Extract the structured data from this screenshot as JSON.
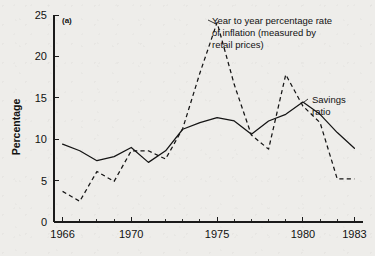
{
  "panel": {
    "label": "(a)"
  },
  "chart_data": {
    "type": "line",
    "title": "",
    "subtitle": "",
    "xlabel": "",
    "ylabel": "Percentage",
    "xlim": [
      1965.5,
      1983.5
    ],
    "ylim": [
      0,
      25
    ],
    "grid": false,
    "legend_position": "inline-annotation",
    "y_ticks": [
      0,
      5,
      10,
      15,
      20,
      25
    ],
    "y_tick_labels": [
      "0",
      "5",
      "10",
      "15",
      "20",
      "25"
    ],
    "x_ticks": [
      1966,
      1967,
      1968,
      1969,
      1970,
      1971,
      1972,
      1973,
      1974,
      1975,
      1976,
      1977,
      1978,
      1979,
      1980,
      1981,
      1982,
      1983
    ],
    "x_tick_labels_shown": [
      "1966",
      "1970",
      "1975",
      "1980",
      "1983"
    ],
    "x_labeled_ticks": [
      1966,
      1970,
      1975,
      1980,
      1983
    ],
    "x": [
      1966,
      1967,
      1968,
      1969,
      1970,
      1971,
      1972,
      1973,
      1974,
      1975,
      1976,
      1977,
      1978,
      1979,
      1980,
      1981,
      1982,
      1983
    ],
    "series": [
      {
        "name": "Savings ratio",
        "style": "solid",
        "values": [
          9.4,
          8.6,
          7.4,
          7.9,
          9.0,
          7.2,
          8.6,
          11.2,
          12.0,
          12.6,
          12.2,
          10.6,
          12.2,
          13.0,
          14.5,
          13.0,
          10.8,
          8.9
        ]
      },
      {
        "name": "Year to year percentage rate of inflation (measured by retail prices)",
        "style": "dashed",
        "values": [
          3.7,
          2.5,
          6.1,
          4.9,
          8.6,
          8.6,
          7.6,
          11.3,
          18.0,
          24.1,
          16.6,
          10.5,
          8.8,
          17.8,
          14.0,
          12.0,
          5.2,
          5.2
        ]
      }
    ],
    "annotations": [
      {
        "id": "inflation-annotation",
        "text_lines": [
          "Year to year percentage rate",
          "of inflation (measured by",
          "retail prices)"
        ],
        "points_to_year": 1975,
        "points_to_value": 24.1
      },
      {
        "id": "savings-annotation",
        "text_lines": [
          "Savings",
          "ratio"
        ],
        "points_to_year": 1980,
        "points_to_value": 14.5
      }
    ]
  },
  "style_colors": {
    "background": "#eeedea",
    "ink": "#141414",
    "axis": "#1a1a1a"
  }
}
